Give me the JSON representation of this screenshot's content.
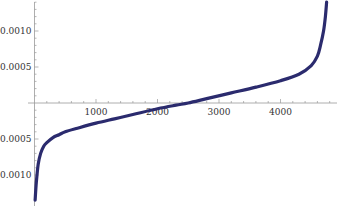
{
  "chart_data": {
    "type": "line",
    "title": "",
    "xlabel": "",
    "ylabel": "",
    "xlim": [
      0,
      4850
    ],
    "ylim": [
      -0.00135,
      0.00145
    ],
    "grid": false,
    "legend": null,
    "x_ticks": [
      1000,
      2000,
      3000,
      4000
    ],
    "x_tick_labels": [
      "1000",
      "2000",
      "3000",
      "4000"
    ],
    "y_ticks": [
      -0.001,
      -0.0005,
      0.0005,
      0.001
    ],
    "y_tick_labels": [
      "-0.0010",
      "-0.0005",
      "0.0005",
      "0.0010"
    ],
    "series": [
      {
        "name": "sorted values",
        "color": "#2b2b6e",
        "x": [
          10,
          30,
          60,
          100,
          150,
          200,
          300,
          400,
          500,
          700,
          1000,
          1300,
          1600,
          2000,
          2300,
          2500,
          2800,
          3200,
          3600,
          4000,
          4300,
          4500,
          4600,
          4650,
          4700,
          4730,
          4750
        ],
        "y": [
          -0.00135,
          -0.0011,
          -0.00085,
          -0.0007,
          -0.0006,
          -0.00055,
          -0.00048,
          -0.00044,
          -0.0004,
          -0.00035,
          -0.00028,
          -0.00022,
          -0.00016,
          -8e-05,
          -3e-05,
          0.0,
          6e-05,
          0.00014,
          0.00022,
          0.00031,
          0.0004,
          0.00052,
          0.00065,
          0.0008,
          0.001,
          0.0012,
          0.0014
        ]
      }
    ]
  }
}
